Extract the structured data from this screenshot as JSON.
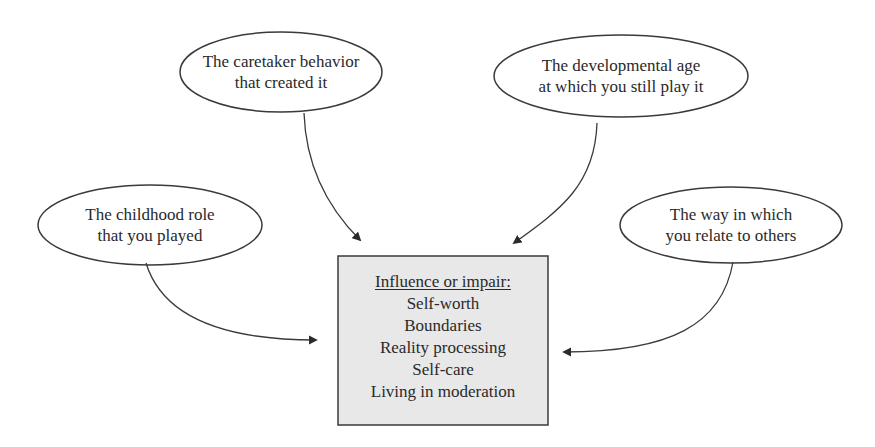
{
  "diagram": {
    "nodes": [
      {
        "id": "caretaker",
        "line1": "The caretaker behavior",
        "line2": "that created it"
      },
      {
        "id": "developmental",
        "line1": "The developmental age",
        "line2": "at which you still play it"
      },
      {
        "id": "childhood",
        "line1": "The childhood role",
        "line2": "that you played"
      },
      {
        "id": "relate",
        "line1": "The way in which",
        "line2": "you relate to others"
      }
    ],
    "center_box": {
      "heading": "Influence or impair:",
      "items": [
        "Self-worth",
        "Boundaries",
        "Reality processing",
        "Self-care",
        "Living in moderation"
      ]
    },
    "edges": [
      {
        "from": "caretaker",
        "to": "center_box"
      },
      {
        "from": "developmental",
        "to": "center_box"
      },
      {
        "from": "childhood",
        "to": "center_box"
      },
      {
        "from": "relate",
        "to": "center_box"
      }
    ],
    "colors": {
      "stroke": "#3a3a3a",
      "box_fill": "#e8e8e8",
      "text": "#2a2a2a",
      "background": "#ffffff"
    }
  }
}
